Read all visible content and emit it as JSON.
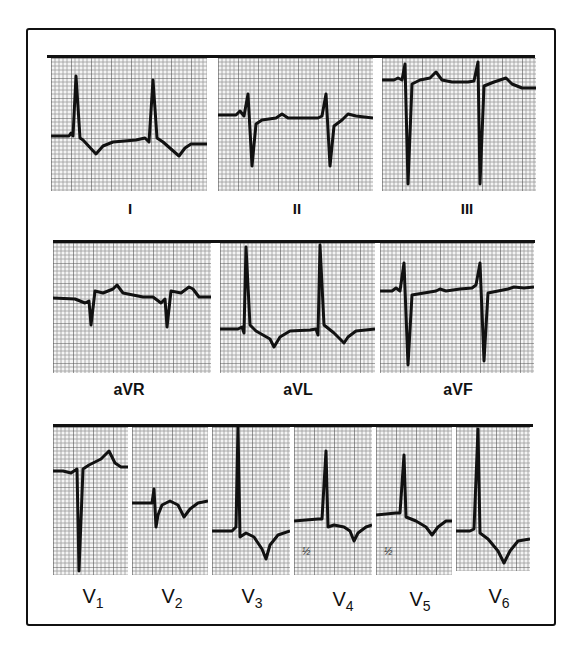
{
  "figure": {
    "rows": [
      {
        "name": "limb-leads",
        "leads": [
          {
            "id": "I",
            "label": "I"
          },
          {
            "id": "II",
            "label": "II"
          },
          {
            "id": "III",
            "label": "III"
          }
        ]
      },
      {
        "name": "augmented-leads",
        "leads": [
          {
            "id": "aVR",
            "label": "aVR"
          },
          {
            "id": "aVL",
            "label": "aVL"
          },
          {
            "id": "aVF",
            "label": "aVF"
          }
        ]
      },
      {
        "name": "precordial-leads",
        "leads": [
          {
            "id": "V1",
            "label": "V",
            "sub": "1"
          },
          {
            "id": "V2",
            "label": "V",
            "sub": "2"
          },
          {
            "id": "V3",
            "label": "V",
            "sub": "3"
          },
          {
            "id": "V4",
            "label": "V",
            "sub": "4",
            "annotation": "½"
          },
          {
            "id": "V5",
            "label": "V",
            "sub": "5",
            "annotation": "½"
          },
          {
            "id": "V6",
            "label": "V",
            "sub": "6"
          }
        ]
      }
    ],
    "colors": {
      "trace": "#111111",
      "grid_fine": "#9a9a9a",
      "grid_major": "#555555",
      "paper": "#f4f4f4",
      "frame": "#111111"
    }
  }
}
